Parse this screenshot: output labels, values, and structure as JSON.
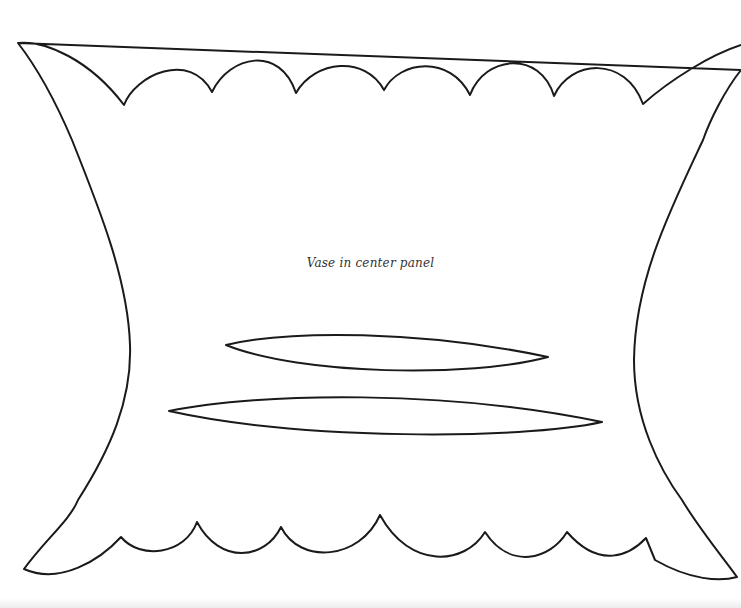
{
  "figure": {
    "caption": "Vase in center panel",
    "stroke_color": "#1a1a1a",
    "background_color": "#ffffff",
    "shapes": [
      {
        "name": "outer-panel",
        "type": "scalloped-outline"
      },
      {
        "name": "upper-leaf",
        "type": "leaf"
      },
      {
        "name": "lower-leaf",
        "type": "leaf"
      }
    ]
  }
}
